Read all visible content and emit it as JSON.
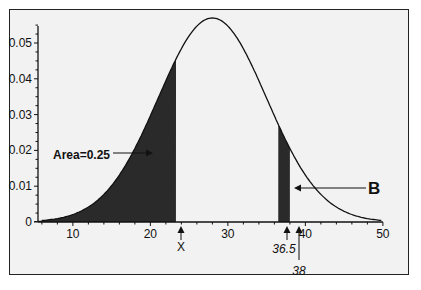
{
  "chart_data": {
    "type": "area",
    "title": "",
    "xlabel": "",
    "ylabel": "",
    "distribution": "normal",
    "mean": 28,
    "sd": 7,
    "xlim": [
      5,
      50
    ],
    "ylim": [
      0,
      0.057
    ],
    "x_ticks": [
      10,
      20,
      30,
      40,
      50
    ],
    "y_ticks": [
      0,
      0.01,
      0.02,
      0.03,
      0.04,
      0.05
    ],
    "y_tick_labels": [
      "0",
      "0.01",
      "0.02",
      "0.03",
      "0.04",
      "0.05"
    ],
    "x_tick_labels": [
      "10",
      "20",
      "30",
      "40",
      "50"
    ],
    "shaded_regions": [
      {
        "from": 5,
        "to": 23.3,
        "label": "Area=0.25"
      },
      {
        "from": 36.5,
        "to": 38,
        "label": "B"
      }
    ],
    "markers": [
      {
        "x": 23.3,
        "label": "X"
      },
      {
        "x": 36.5,
        "label": "36.5"
      },
      {
        "x": 38,
        "label": "38"
      }
    ],
    "grid": false,
    "legend": null
  },
  "labels": {
    "area": "Area=0.25",
    "b": "B",
    "x_marker": "X",
    "m365": "36.5",
    "m38": "38"
  },
  "colors": {
    "shade": "#2a2a2a",
    "curve": "#111111",
    "background": "#f2f2f2"
  }
}
